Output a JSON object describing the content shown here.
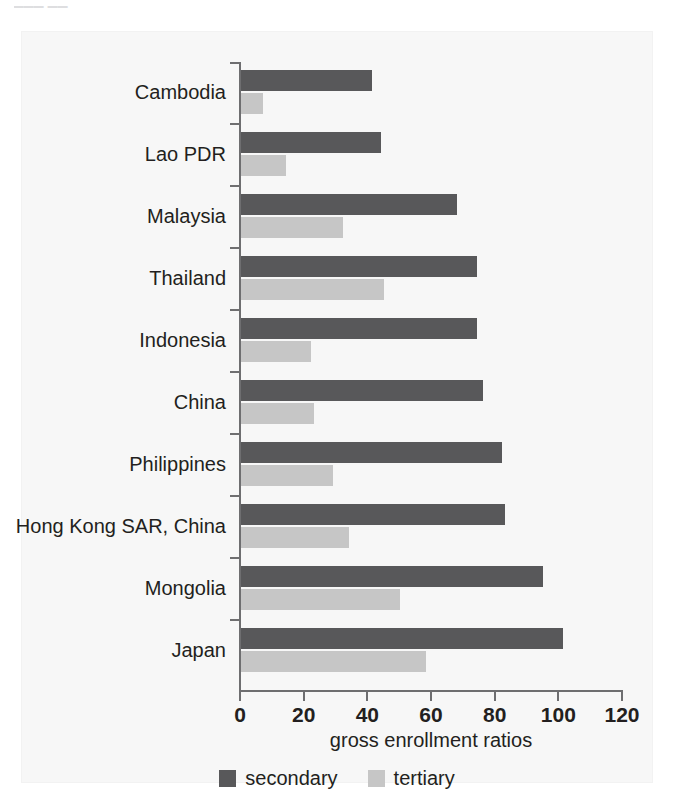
{
  "page": {
    "top_remnant": "▁▁▁ ▁▁"
  },
  "chart_data": {
    "type": "bar",
    "orientation": "horizontal",
    "title": "",
    "xlabel": "gross enrollment ratios",
    "ylabel": "",
    "xlim": [
      0,
      120
    ],
    "xticks": [
      0,
      20,
      40,
      60,
      80,
      100,
      120
    ],
    "xtick_labels": [
      "0",
      "20",
      "40",
      "60",
      "80",
      "100",
      "120"
    ],
    "grid": false,
    "legend_position": "bottom-center",
    "categories": [
      "Cambodia",
      "Lao PDR",
      "Malaysia",
      "Thailand",
      "Indonesia",
      "China",
      "Philippines",
      "Hong Kong SAR, China",
      "Mongolia",
      "Japan"
    ],
    "series": [
      {
        "name": "secondary",
        "color": "#58585a",
        "values": [
          41,
          44,
          68,
          74,
          74,
          76,
          82,
          83,
          95,
          101
        ]
      },
      {
        "name": "tertiary",
        "color": "#c6c6c6",
        "values": [
          7,
          14,
          32,
          45,
          22,
          23,
          29,
          34,
          50,
          58
        ]
      }
    ]
  },
  "legend": {
    "items": [
      {
        "label": "secondary",
        "color": "#58585a"
      },
      {
        "label": "tertiary",
        "color": "#c6c6c6"
      }
    ]
  }
}
